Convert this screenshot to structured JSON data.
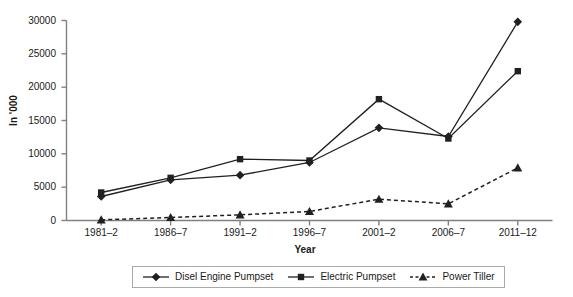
{
  "chart_data": {
    "type": "line",
    "title": "",
    "xlabel": "Year",
    "ylabel": "In '000",
    "categories": [
      "1981–2",
      "1986–7",
      "1991–2",
      "1996–7",
      "2001–2",
      "2006–7",
      "2011–12"
    ],
    "series": [
      {
        "name": "Disel Engine Pumpset",
        "marker": "diamond",
        "line_style": "solid",
        "color": "#231f20",
        "values": [
          3600,
          6100,
          6800,
          8700,
          13900,
          12600,
          29800
        ]
      },
      {
        "name": "Electric Pumpset",
        "marker": "square",
        "line_style": "solid",
        "color": "#231f20",
        "values": [
          4200,
          6400,
          9200,
          9000,
          18200,
          12300,
          22400
        ]
      },
      {
        "name": "Power Tiller",
        "marker": "triangle",
        "line_style": "dashed",
        "color": "#231f20",
        "values": [
          100,
          450,
          850,
          1350,
          3200,
          2500,
          7900
        ]
      }
    ],
    "ylim": [
      0,
      30000
    ],
    "yticks": [
      0,
      5000,
      10000,
      15000,
      20000,
      25000,
      30000
    ],
    "ytick_labels": [
      "0",
      "5000",
      "10000",
      "15000",
      "20000",
      "25000",
      "30000"
    ],
    "grid": false,
    "legend_position": "bottom"
  },
  "legend": {
    "entries": [
      {
        "label": "Disel Engine Pumpset",
        "marker": "diamond-marker-icon",
        "line_style": "solid"
      },
      {
        "label": "Electric Pumpset",
        "marker": "square-marker-icon",
        "line_style": "solid"
      },
      {
        "label": "Power Tiller",
        "marker": "triangle-marker-icon",
        "line_style": "dashed"
      }
    ]
  },
  "axes": {
    "y_title": "In '000",
    "x_title": "Year"
  },
  "colors": {
    "line": "#231f20",
    "axis": "#808080",
    "text": "#1a1a1a",
    "legend_border": "#aaaaaa",
    "background": "#ffffff"
  }
}
